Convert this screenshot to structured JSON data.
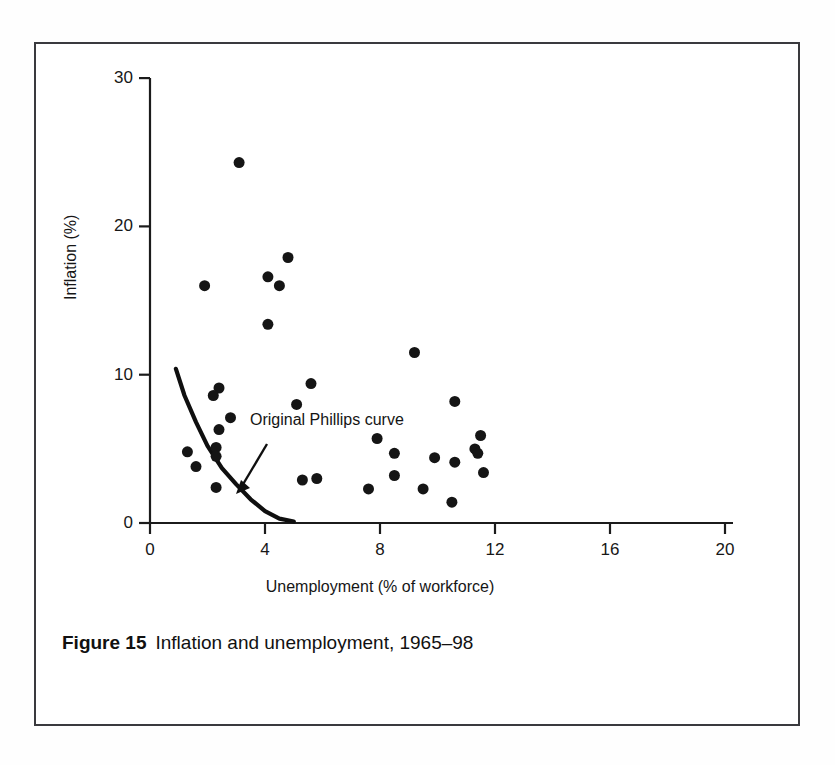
{
  "figure": {
    "caption_number": "Figure 15",
    "caption_text": "Inflation and unemployment, 1965–98"
  },
  "chart_data": {
    "type": "scatter",
    "title": "",
    "xlabel": "Unemployment (% of workforce)",
    "ylabel": "Inflation (%)",
    "xlim": [
      0,
      20
    ],
    "ylim": [
      0,
      30
    ],
    "xticks": [
      0,
      4,
      8,
      12,
      16,
      20
    ],
    "yticks": [
      0,
      10,
      20,
      30
    ],
    "xtick_labels": [
      "0",
      "4",
      "8",
      "12",
      "16",
      "20"
    ],
    "ytick_labels": [
      "0",
      "10",
      "20",
      "30"
    ],
    "grid": false,
    "legend": "none",
    "marker": {
      "shape": "circle",
      "color": "#151515",
      "size_px": 11
    },
    "points": [
      {
        "x": 3.1,
        "y": 24.3
      },
      {
        "x": 4.8,
        "y": 17.9
      },
      {
        "x": 4.1,
        "y": 16.6
      },
      {
        "x": 4.5,
        "y": 16.0
      },
      {
        "x": 1.9,
        "y": 16.0
      },
      {
        "x": 4.1,
        "y": 13.4
      },
      {
        "x": 9.2,
        "y": 11.5
      },
      {
        "x": 5.6,
        "y": 9.4
      },
      {
        "x": 2.4,
        "y": 9.1
      },
      {
        "x": 2.2,
        "y": 8.6
      },
      {
        "x": 10.6,
        "y": 8.2
      },
      {
        "x": 5.1,
        "y": 8.0
      },
      {
        "x": 2.8,
        "y": 7.1
      },
      {
        "x": 2.4,
        "y": 6.3
      },
      {
        "x": 1.3,
        "y": 4.8
      },
      {
        "x": 2.3,
        "y": 5.1
      },
      {
        "x": 2.3,
        "y": 4.5
      },
      {
        "x": 7.9,
        "y": 5.7
      },
      {
        "x": 11.5,
        "y": 5.9
      },
      {
        "x": 11.3,
        "y": 5.0
      },
      {
        "x": 11.4,
        "y": 4.7
      },
      {
        "x": 8.5,
        "y": 4.7
      },
      {
        "x": 9.9,
        "y": 4.4
      },
      {
        "x": 10.6,
        "y": 4.1
      },
      {
        "x": 11.6,
        "y": 3.4
      },
      {
        "x": 1.6,
        "y": 3.8
      },
      {
        "x": 8.5,
        "y": 3.2
      },
      {
        "x": 5.3,
        "y": 2.9
      },
      {
        "x": 5.8,
        "y": 3.0
      },
      {
        "x": 7.6,
        "y": 2.3
      },
      {
        "x": 9.5,
        "y": 2.3
      },
      {
        "x": 2.3,
        "y": 2.4
      },
      {
        "x": 10.5,
        "y": 1.4
      }
    ],
    "annotations": [
      {
        "text": "Original Phillips curve",
        "label_x_px": 250,
        "label_y_px": 411,
        "arrow_from": [
          267,
          444
        ],
        "arrow_to": [
          236,
          494
        ]
      }
    ],
    "curve": {
      "name": "Original Phillips curve",
      "points": [
        {
          "x": 0.9,
          "y": 10.4
        },
        {
          "x": 1.2,
          "y": 8.6
        },
        {
          "x": 1.6,
          "y": 6.8
        },
        {
          "x": 2.0,
          "y": 5.2
        },
        {
          "x": 2.5,
          "y": 3.7
        },
        {
          "x": 3.0,
          "y": 2.6
        },
        {
          "x": 3.5,
          "y": 1.6
        },
        {
          "x": 4.0,
          "y": 0.8
        },
        {
          "x": 4.5,
          "y": 0.3
        },
        {
          "x": 5.0,
          "y": 0.1
        }
      ]
    },
    "colors": {
      "axis": "#1b1b1b",
      "marker": "#151515",
      "curve": "#0f0f0f",
      "frame": "#3a3a3e",
      "background": "#ffffff"
    }
  }
}
